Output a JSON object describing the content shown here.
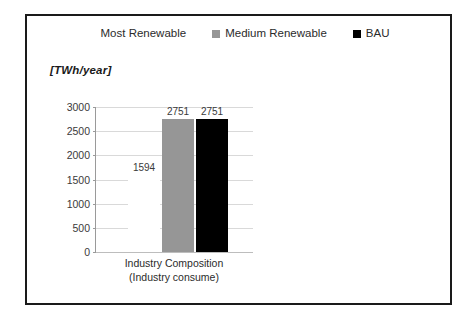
{
  "figure": {
    "frame_color": "#1a1a1a",
    "background": "#ffffff"
  },
  "legend": {
    "position": "top-center",
    "items": [
      {
        "label": "Most Renewable",
        "swatch_name": "legend-swatch-most-renewable",
        "color": "#ffffff"
      },
      {
        "label": "Medium Renewable",
        "swatch_name": "legend-swatch-medium-renewable",
        "color": "#969696"
      },
      {
        "label": "BAU",
        "swatch_name": "legend-swatch-bau",
        "color": "#000000"
      }
    ]
  },
  "axis": {
    "unit_caption": "[TWh/year]",
    "y_ticks": [
      "3000",
      "2500",
      "2000",
      "1500",
      "1000",
      "500",
      "0"
    ],
    "x_label_line1": "Industry Composition",
    "x_label_line2": "(Industry consume)"
  },
  "chart_data": {
    "type": "bar",
    "title": "",
    "subtitle": "",
    "xlabel": "Industry Composition (Industry consume)",
    "ylabel": "[TWh/year]",
    "ylim": [
      0,
      3000
    ],
    "ytick_step": 500,
    "grid": true,
    "legend_position": "top-center",
    "categories": [
      "Industry Composition (Industry consume)"
    ],
    "series": [
      {
        "name": "Most Renewable",
        "values": [
          1594
        ],
        "color": "#ffffff",
        "label": "1594"
      },
      {
        "name": "Medium Renewable",
        "values": [
          2751
        ],
        "color": "#969696",
        "label": "2751"
      },
      {
        "name": "BAU",
        "values": [
          2751
        ],
        "color": "#000000",
        "label": "2751"
      }
    ]
  }
}
